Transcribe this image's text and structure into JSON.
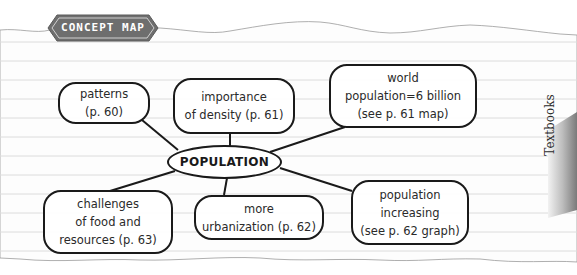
{
  "header": {
    "badge_label": "CONCEPT MAP",
    "badge_color": "#6e6e6e"
  },
  "concept_map": {
    "center": {
      "label": "POPULATION"
    },
    "nodes": [
      {
        "id": "patterns",
        "lines": [
          "patterns",
          "(p. 60)"
        ]
      },
      {
        "id": "density",
        "lines": [
          "importance",
          "of density (p. 61)"
        ]
      },
      {
        "id": "world-population",
        "lines": [
          "world",
          "population=6 billion",
          "(see p. 61 map)"
        ]
      },
      {
        "id": "challenges",
        "lines": [
          "challenges",
          "of food and",
          "resources (p. 63)"
        ]
      },
      {
        "id": "urbanization",
        "lines": [
          "more",
          "urbanization (p. 62)"
        ]
      },
      {
        "id": "population-increasing",
        "lines": [
          "population",
          "increasing",
          "(see p. 62 graph)"
        ]
      }
    ]
  },
  "side_tab": {
    "label": "Textbooks"
  },
  "colors": {
    "ink": "#1a1a1a",
    "ruled_line": "#d9d9d9",
    "paper": "#ffffff"
  }
}
